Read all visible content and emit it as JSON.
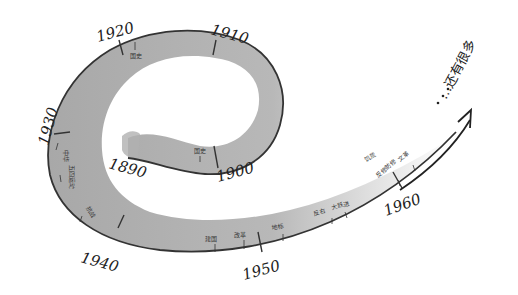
{
  "diagram": {
    "type": "spiral-timeline",
    "colors": {
      "band_dark": "#a8a8a8",
      "band_light": "#f2f2f2",
      "outline": "#333333",
      "ink": "#222222"
    },
    "start_year": "1890",
    "decades": [
      {
        "label": "1890",
        "x": 108,
        "y": 165,
        "rot": 15
      },
      {
        "label": "1900",
        "x": 222,
        "y": 178,
        "rot": -15
      },
      {
        "label": "1910",
        "x": 212,
        "y": 38,
        "rot": 15
      },
      {
        "label": "1920",
        "x": 98,
        "y": 44,
        "rot": -15
      },
      {
        "label": "1930",
        "x": 44,
        "y": 148,
        "rot": -75
      },
      {
        "label": "1940",
        "x": 80,
        "y": 262,
        "rot": 15
      },
      {
        "label": "1950",
        "x": 248,
        "y": 275,
        "rot": -15
      },
      {
        "label": "1960",
        "x": 392,
        "y": 214,
        "rot": -20
      }
    ],
    "events": [
      {
        "label": "国史",
        "x": 133,
        "y": 55
      },
      {
        "label": "国史",
        "x": 196,
        "y": 152
      },
      {
        "label": "中华",
        "x": 58,
        "y": 152
      },
      {
        "label": "五四运动",
        "x": 62,
        "y": 172
      },
      {
        "label": "抗战",
        "x": 85,
        "y": 213
      },
      {
        "label": "建国",
        "x": 205,
        "y": 241
      },
      {
        "label": "改革",
        "x": 235,
        "y": 237
      },
      {
        "label": "地标",
        "x": 272,
        "y": 230
      },
      {
        "label": "反右",
        "x": 317,
        "y": 215
      },
      {
        "label": "大跃进",
        "x": 335,
        "y": 208
      },
      {
        "label": "饥荒",
        "x": 368,
        "y": 162
      },
      {
        "label": "反修防修",
        "x": 380,
        "y": 178
      },
      {
        "label": "文革",
        "x": 402,
        "y": 160
      }
    ],
    "continuation_label": "…还有很多"
  }
}
